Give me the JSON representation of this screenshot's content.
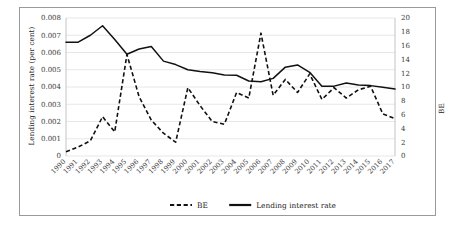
{
  "figure": {
    "border_color": "#9a9a9a",
    "background": "#ffffff"
  },
  "axis": {
    "left_title": "Lending interest rate (per cent)",
    "right_title": "BE"
  },
  "legend": {
    "items": [
      {
        "label": "BE",
        "style": "dashed"
      },
      {
        "label": "Lending interest rate",
        "style": "solid"
      }
    ]
  },
  "chart_data": {
    "type": "line",
    "title": "",
    "xlabel": "",
    "ylabel": "Lending interest rate (per cent)",
    "y2label": "BE",
    "grid": true,
    "legend_position": "bottom",
    "x": [
      "1990",
      "1991",
      "1992",
      "1993",
      "1994",
      "1995",
      "1996",
      "1997",
      "1998",
      "1999",
      "2000",
      "2001",
      "2002",
      "2003",
      "2004",
      "2005",
      "2006",
      "2007",
      "2008",
      "2009",
      "2010",
      "2011",
      "2012",
      "2013",
      "2014",
      "2015",
      "2016",
      "2017"
    ],
    "ylim": [
      0,
      0.008
    ],
    "yticks": [
      0,
      0.001,
      0.002,
      0.003,
      0.004,
      0.005,
      0.006,
      0.007,
      0.008
    ],
    "ytick_labels": [
      "0",
      "0.001",
      "0.002",
      "0.003",
      "0.004",
      "0.005",
      "0.006",
      "0.007",
      "0.008"
    ],
    "y2lim": [
      0,
      20
    ],
    "y2ticks": [
      0,
      2,
      4,
      6,
      8,
      10,
      12,
      14,
      16,
      18,
      20
    ],
    "y2tick_labels": [
      "0",
      "2",
      "4",
      "6",
      "8",
      "10",
      "12",
      "14",
      "16",
      "18",
      "20"
    ],
    "series": [
      {
        "name": "Lending interest rate",
        "axis": "left",
        "style": "solid",
        "color": "#111111",
        "values": [
          0.0066,
          0.0066,
          0.007,
          0.00755,
          0.00675,
          0.0059,
          0.0062,
          0.00635,
          0.0055,
          0.0053,
          0.005,
          0.0049,
          0.00483,
          0.0047,
          0.00468,
          0.00435,
          0.0043,
          0.0045,
          0.00515,
          0.00528,
          0.00485,
          0.00405,
          0.00405,
          0.00423,
          0.00412,
          0.00408,
          0.00398,
          0.00388
        ]
      },
      {
        "name": "BE",
        "axis": "right",
        "style": "dashed",
        "color": "#111111",
        "values": [
          0.6,
          1.3,
          2.2,
          5.7,
          3.5,
          14.7,
          8.6,
          5.2,
          3.3,
          2.0,
          9.9,
          7.3,
          5.0,
          4.6,
          9.2,
          8.4,
          17.8,
          8.8,
          11.1,
          9.2,
          11.9,
          8.2,
          9.9,
          8.4,
          9.6,
          10.1,
          6.1,
          5.4
        ]
      }
    ]
  }
}
